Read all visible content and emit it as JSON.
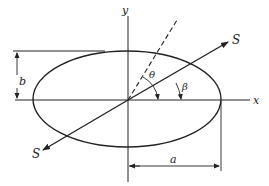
{
  "diagram": {
    "type": "ellipse-with-axes",
    "labels": {
      "x_axis": "x",
      "y_axis": "y",
      "semi_minor": "b",
      "semi_major": "a",
      "theta": "θ",
      "beta": "β",
      "s_end": "S",
      "s_start": "S"
    },
    "colors": {
      "stroke": "#222222",
      "background": "#ffffff"
    }
  }
}
